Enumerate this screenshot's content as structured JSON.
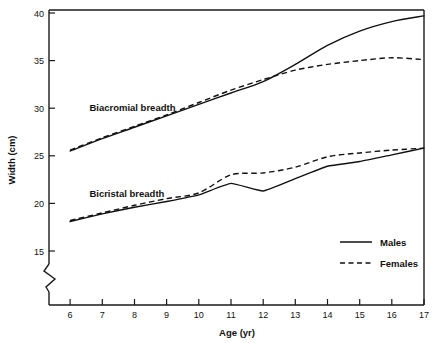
{
  "chart_data": {
    "type": "line",
    "title": "",
    "xlabel": "Age (yr)",
    "ylabel": "Width (cm)",
    "x": [
      6,
      7,
      8,
      9,
      10,
      11,
      12,
      13,
      14,
      15,
      16,
      17
    ],
    "xlim": [
      6,
      17
    ],
    "ylim": [
      15,
      40
    ],
    "xticks": [
      "6",
      "7",
      "8",
      "9",
      "10",
      "11",
      "12",
      "13",
      "14",
      "15",
      "16",
      "17"
    ],
    "yticks": [
      "15",
      "20",
      "25",
      "30",
      "35",
      "40"
    ],
    "grid": false,
    "y_axis_break": true,
    "y_axis_break_note": "zigzag break below 15",
    "legend_position": "lower-right inside plot",
    "series": [
      {
        "name": "Males",
        "group": "Biacromial breadth",
        "style": "solid",
        "color": "#111111",
        "values": [
          25.5,
          26.8,
          28.0,
          29.2,
          30.4,
          31.6,
          32.8,
          34.6,
          36.6,
          38.1,
          39.1,
          39.7
        ]
      },
      {
        "name": "Females",
        "group": "Biacromial breadth",
        "style": "dashed",
        "color": "#111111",
        "values": [
          25.6,
          26.9,
          28.1,
          29.3,
          30.6,
          31.9,
          33.0,
          34.0,
          34.6,
          35.0,
          35.3,
          35.1
        ]
      },
      {
        "name": "Males",
        "group": "Bicristal breadth",
        "style": "solid",
        "color": "#111111",
        "values": [
          18.1,
          18.9,
          19.6,
          20.2,
          20.9,
          22.1,
          21.3,
          22.6,
          23.9,
          24.4,
          25.1,
          25.8
        ]
      },
      {
        "name": "Females",
        "group": "Bicristal breadth",
        "style": "dashed",
        "color": "#111111",
        "values": [
          18.2,
          19.0,
          19.8,
          20.5,
          21.1,
          23.0,
          23.2,
          23.8,
          24.9,
          25.3,
          25.6,
          25.8
        ]
      }
    ],
    "annotations": [
      {
        "text": "Biacromial breadth",
        "x": 6.6,
        "y": 30.0
      },
      {
        "text": "Bicristal breadth",
        "x": 6.6,
        "y": 21.0
      }
    ],
    "legend": [
      {
        "label": "Males",
        "style": "solid"
      },
      {
        "label": "Females",
        "style": "dashed"
      }
    ]
  }
}
